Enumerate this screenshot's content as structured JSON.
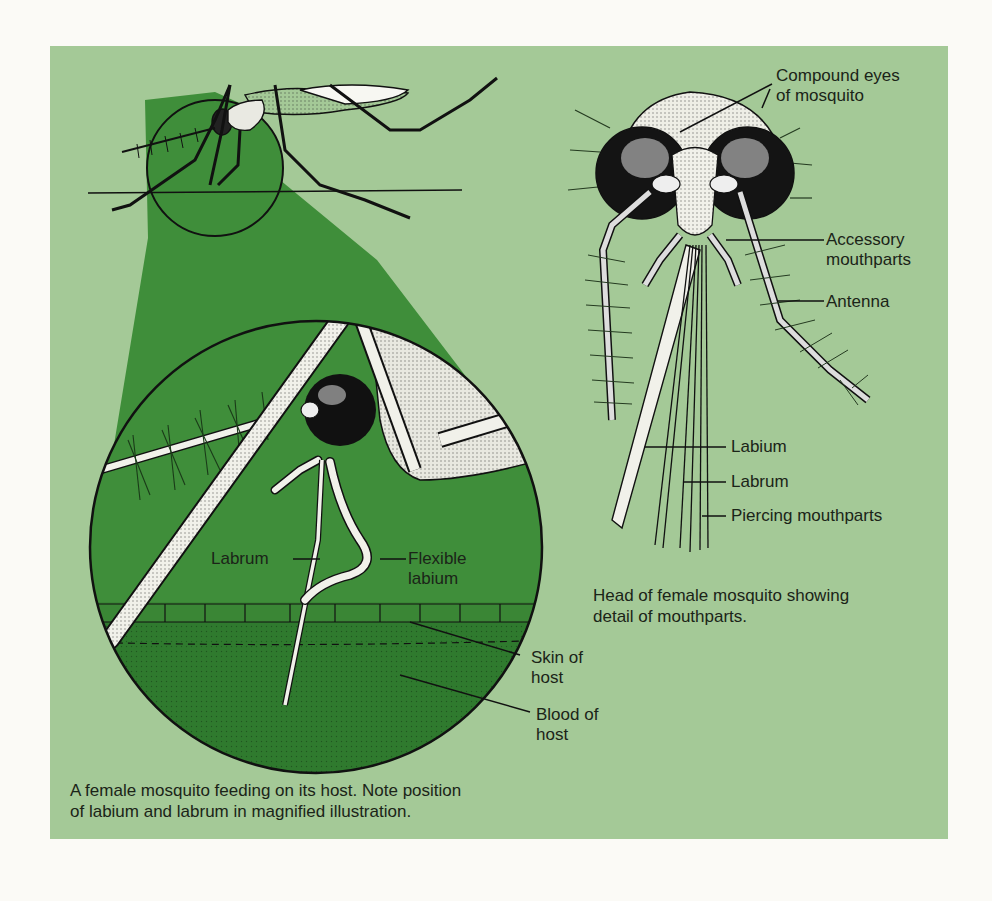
{
  "colors": {
    "page_background": "#fbfaf6",
    "panel_background": "#a4c997",
    "magnified_green": "#3f8e3a",
    "blood_green": "#2f7a2e",
    "text": "#1b2418",
    "ink": "#111111"
  },
  "left_figure": {
    "labels": {
      "labrum": "Labrum",
      "flexible_labium": "Flexible\nlabium",
      "skin_of_host": "Skin of\nhost",
      "blood_of_host": "Blood of\nhost"
    },
    "caption": "A female mosquito feeding on its host. Note position\nof labium and labrum in magnified illustration."
  },
  "right_figure": {
    "labels": {
      "compound_eyes": "Compound eyes\nof mosquito",
      "accessory_mouthparts": "Accessory\nmouthparts",
      "antenna": "Antenna",
      "labium": "Labium",
      "labrum": "Labrum",
      "piercing_mouthparts": "Piercing mouthparts"
    },
    "caption": "Head of female mosquito showing\ndetail of mouthparts."
  }
}
